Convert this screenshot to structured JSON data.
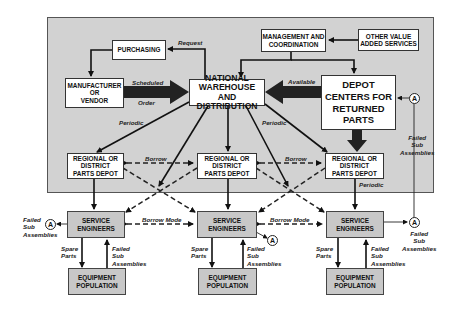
{
  "diagram": {
    "boxes": {
      "purchasing": "PURCHASING",
      "manufacturer": "MANUFACTURER\nOR\nVENDOR",
      "national_warehouse": "NATIONAL\nWAREHOUSE\nAND DISTRIBUTION",
      "management": "MANAGEMENT AND\nCOORDINATION",
      "other_services": "OTHER VALUE\nADDED SERVICES",
      "depot_centers": "DEPOT\nCENTERS FOR\nRETURNED\nPARTS",
      "regional_left": "REGIONAL OR\nDISTRICT\nPARTS DEPOT",
      "regional_mid": "REGIONAL OR\nDISTRICT\nPARTS DEPOT",
      "regional_right": "REGIONAL OR\nDISTRICT\nPARTS DEPOT",
      "service_left": "SERVICE\nENGINEERS",
      "service_mid": "SERVICE\nENGINEERS",
      "service_right": "SERVICE\nENGINEERS",
      "equipment_left": "EQUIPMENT\nPOPULATION",
      "equipment_mid": "EQUIPMENT\nPOPULATION",
      "equipment_right": "EQUIPMENT\nPOPULATION"
    },
    "labels": {
      "request": "Request",
      "scheduled": "Scheduled",
      "order": "Order",
      "available": "Available",
      "periodic_left": "Periodic",
      "periodic_mid": "Periodic",
      "periodic_right": "Periodic",
      "borrow_left": "Borrow",
      "borrow_right": "Borrow",
      "borrow_mode_left": "Borrow  Mode",
      "borrow_mode_right": "Borrow  Mode",
      "failed_sub_left": "Failed\nSub\nAssemblies",
      "failed_sub_top_right": "Failed\nSub\nAssemblies",
      "failed_sub_bottom_right": "Failed\nSub\nAssemblies",
      "spare_parts_left": "Spare\nParts",
      "failed_sub_eq_left": "Failed\nSub\nAssemblies",
      "spare_parts_mid": "Spare\nParts",
      "failed_sub_eq_mid": "Failed\nSub\nAssemblies",
      "spare_parts_right": "Spare\nParts",
      "failed_sub_eq_right": "Failed\nSub\nAssemblies"
    },
    "connector_symbol": "A",
    "colors": {
      "panel": "#d2d2d2",
      "box_white": "#ffffff",
      "box_gray": "#c8c8c8",
      "line": "#111111"
    }
  }
}
